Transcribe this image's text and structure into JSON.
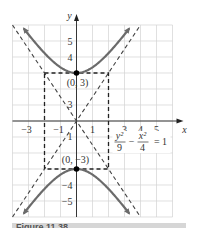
{
  "chart_data": {
    "type": "line",
    "title": "",
    "equation": {
      "num_y": "y²",
      "den_y": "9",
      "minus": "−",
      "num_x": "x²",
      "den_x": "4",
      "rhs": "= 1"
    },
    "xlabel": "x",
    "ylabel": "y",
    "xlim": [
      -4,
      6
    ],
    "ylim": [
      -6,
      6
    ],
    "grid": true,
    "x_tick_labels": [
      "−3",
      "−1",
      "1",
      "3",
      "4",
      "5"
    ],
    "x_tick_values": [
      -3,
      -1,
      1,
      3,
      4,
      5
    ],
    "y_tick_labels": [
      "5",
      "4",
      "−4",
      "−5"
    ],
    "y_tick_values": [
      5,
      4,
      -4,
      -5
    ],
    "series": [
      {
        "name": "upper branch",
        "style": "solid",
        "color": "#6b6b6b",
        "function": "y = 3*sqrt(1 + x^2/4)"
      },
      {
        "name": "lower branch",
        "style": "solid",
        "color": "#6b6b6b",
        "function": "y = -3*sqrt(1 + x^2/4)"
      },
      {
        "name": "asymptote 1",
        "style": "dashed",
        "function": "y = 1.5x"
      },
      {
        "name": "asymptote 2",
        "style": "dashed",
        "function": "y = -1.5x"
      },
      {
        "name": "fundamental rectangle",
        "style": "dashed",
        "corners": [
          [
            -2,
            3
          ],
          [
            2,
            3
          ],
          [
            2,
            -3
          ],
          [
            -2,
            -3
          ]
        ]
      }
    ],
    "points": [
      {
        "x": 0,
        "y": 3,
        "label": "(0, 3)"
      },
      {
        "x": 0,
        "y": -3,
        "label": "(0, −3)"
      }
    ],
    "small_labels": {
      "y3": "3",
      "yminus1": "1"
    }
  },
  "caption": {
    "text": "Figure 11.38"
  }
}
